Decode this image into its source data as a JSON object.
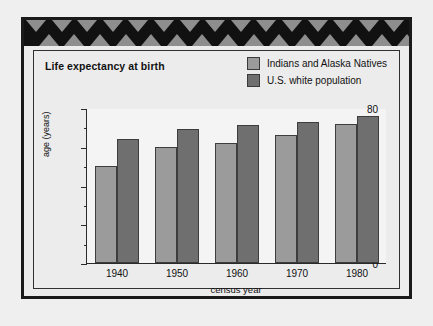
{
  "figure": {
    "border_pattern_name": "southwest-triangle-band",
    "frame_color": "#1a1a1a",
    "background": "#ececec"
  },
  "legend": {
    "entries": [
      {
        "label": "Indians and Alaska Natives",
        "color": "#9b9b9b"
      },
      {
        "label": "U.S. white population",
        "color": "#6f6f6f"
      }
    ]
  },
  "chart_data": {
    "type": "bar",
    "title": "Life expectancy at birth",
    "xlabel": "census year",
    "ylabel": "age (years)",
    "categories": [
      "1940",
      "1950",
      "1960",
      "1970",
      "1980"
    ],
    "series": [
      {
        "name": "Indians and Alaska Natives",
        "color": "#9b9b9b",
        "values": [
          50,
          60,
          62,
          66,
          72
        ]
      },
      {
        "name": "U.S. white population",
        "color": "#6f6f6f",
        "values": [
          64,
          69,
          71,
          73,
          76
        ]
      }
    ],
    "ylim": [
      0,
      80
    ],
    "ytick_major": [
      0,
      20,
      40,
      60,
      80
    ],
    "ytick_minor": [
      10,
      30,
      50,
      70
    ],
    "ytick_labels": [
      "0",
      "20",
      "40",
      "60",
      "80"
    ],
    "grid": false,
    "legend_position": "top-right"
  }
}
